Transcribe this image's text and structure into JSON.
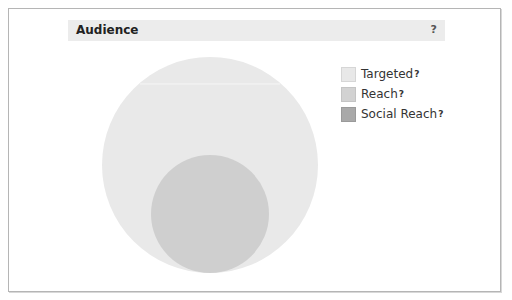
{
  "header": {
    "title": "Audience",
    "help": "?"
  },
  "legend": {
    "items": [
      {
        "label": "Targeted",
        "help": "?",
        "color": "#e8e8e8",
        "border": "#d6d6d6"
      },
      {
        "label": "Reach",
        "help": "?",
        "color": "#d2d2d2",
        "border": "#c4c4c4"
      },
      {
        "label": "Social Reach",
        "help": "?",
        "color": "#a9a9a9",
        "border": "#9a9a9a"
      }
    ]
  },
  "venn": {
    "circles": [
      {
        "name": "Targeted",
        "cx": 210,
        "cy": 165,
        "r": 108,
        "fill": "#e9e9e9"
      },
      {
        "name": "Reach",
        "cx": 210,
        "cy": 214,
        "r": 59,
        "fill": "#cfcfcf"
      }
    ]
  }
}
